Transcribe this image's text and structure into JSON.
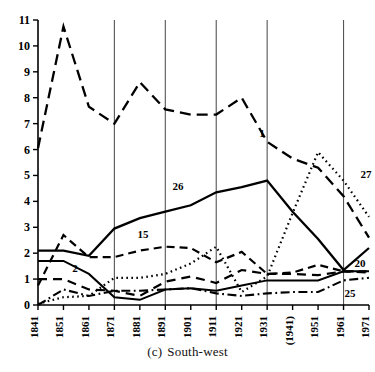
{
  "caption": {
    "index": "(c)",
    "text": "South-west"
  },
  "chart_data": {
    "type": "line",
    "xlabel": "",
    "ylabel": "",
    "grid": "vertical gridlines at 1871, 1891, 1911, 1931, 1961",
    "legend_position": "inline end-of-line labels",
    "x": [
      "1841",
      "1851",
      "1861",
      "1871",
      "1881",
      "1891",
      "1901",
      "1911",
      "1921",
      "1931",
      "(1941)",
      "1951",
      "1961",
      "1971"
    ],
    "xlim": [
      1841,
      1971
    ],
    "ylim": [
      0,
      11
    ],
    "yticks": [
      "0",
      "1",
      "2",
      "3",
      "4",
      "5",
      "6",
      "7",
      "8",
      "9",
      "10",
      "11"
    ],
    "xticks": [
      "1841",
      "1851",
      "1861",
      "1871",
      "1881",
      "1891",
      "1901",
      "1911",
      "1921",
      "1931",
      "(1941)",
      "1951",
      "1961",
      "1971"
    ],
    "gridlines_x": [
      "1871",
      "1891",
      "1911",
      "1931",
      "1961"
    ],
    "series": [
      {
        "name": "1",
        "label": "1",
        "style": "long-dash",
        "values": [
          6.05,
          10.75,
          7.65,
          7.0,
          8.6,
          7.55,
          7.35,
          7.35,
          8.0,
          6.3,
          5.65,
          5.3,
          4.2,
          2.6
        ]
      },
      {
        "name": "26",
        "label": "26",
        "style": "solid",
        "values": [
          2.1,
          2.1,
          1.9,
          2.95,
          3.35,
          3.6,
          3.85,
          4.35,
          4.55,
          4.8,
          3.6,
          2.55,
          1.35,
          2.2
        ]
      },
      {
        "name": "15",
        "label": "15",
        "style": "dash",
        "values": [
          0.75,
          2.7,
          1.85,
          1.85,
          2.1,
          2.25,
          2.2,
          1.65,
          2.05,
          1.2,
          1.25,
          1.55,
          1.3,
          1.3
        ]
      },
      {
        "name": "27",
        "label": "27",
        "style": "dot",
        "values": [
          0.05,
          0.3,
          0.35,
          1.05,
          1.05,
          1.2,
          1.6,
          2.25,
          0.5,
          1.1,
          3.55,
          5.9,
          4.8,
          3.4
        ]
      },
      {
        "name": "2",
        "label": "2",
        "style": "solid-thin",
        "values": [
          1.7,
          1.7,
          1.2,
          0.3,
          0.2,
          0.6,
          0.65,
          0.55,
          0.75,
          0.95,
          0.95,
          0.95,
          1.3,
          1.3
        ]
      },
      {
        "name": "20",
        "label": "20",
        "style": "med-dash",
        "values": [
          1.0,
          1.0,
          0.6,
          0.55,
          0.35,
          0.9,
          1.1,
          0.85,
          1.35,
          1.2,
          1.2,
          1.15,
          1.3,
          1.25
        ]
      },
      {
        "name": "25",
        "label": "25",
        "style": "dash-dot",
        "values": [
          0.0,
          0.6,
          0.35,
          0.55,
          0.55,
          0.6,
          0.65,
          0.45,
          0.35,
          0.45,
          0.5,
          0.5,
          0.95,
          1.05
        ]
      }
    ],
    "series_labels": [
      {
        "name": "1",
        "x": 262,
        "y": 137
      },
      {
        "name": "27",
        "x": 366,
        "y": 178
      },
      {
        "name": "26",
        "x": 178,
        "y": 190
      },
      {
        "name": "15",
        "x": 143,
        "y": 238
      },
      {
        "name": "2",
        "x": 75,
        "y": 272
      },
      {
        "name": "20",
        "x": 360,
        "y": 267
      },
      {
        "name": "25",
        "x": 350,
        "y": 297
      }
    ],
    "colors": {
      "line": "#000000",
      "gridline": "#555555",
      "axis": "#000000",
      "background": "#ffffff"
    }
  }
}
